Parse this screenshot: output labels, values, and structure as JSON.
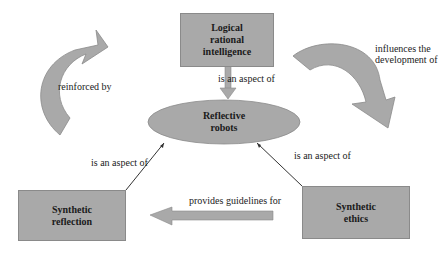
{
  "nodes": {
    "logical": {
      "line1": "Logical",
      "line2": "rational",
      "line3": "intelligence"
    },
    "reflective": {
      "line1": "Reflective",
      "line2": "robots"
    },
    "synth_reflection": {
      "line1": "Synthetic",
      "line2": "reflection"
    },
    "synth_ethics": {
      "line1": "Synthetic",
      "line2": "ethics"
    }
  },
  "edges": {
    "reinforced_by": "reinforced by",
    "influences_line1": "influences the",
    "influences_line2": "development of",
    "aspect_top": "is an aspect of",
    "aspect_left": "is an aspect of",
    "aspect_right": "is an aspect of",
    "provides_guidelines": "provides guidelines for"
  },
  "colors": {
    "fill": "#a9a9a9",
    "stroke": "#8a8a8a",
    "line": "#333333"
  }
}
